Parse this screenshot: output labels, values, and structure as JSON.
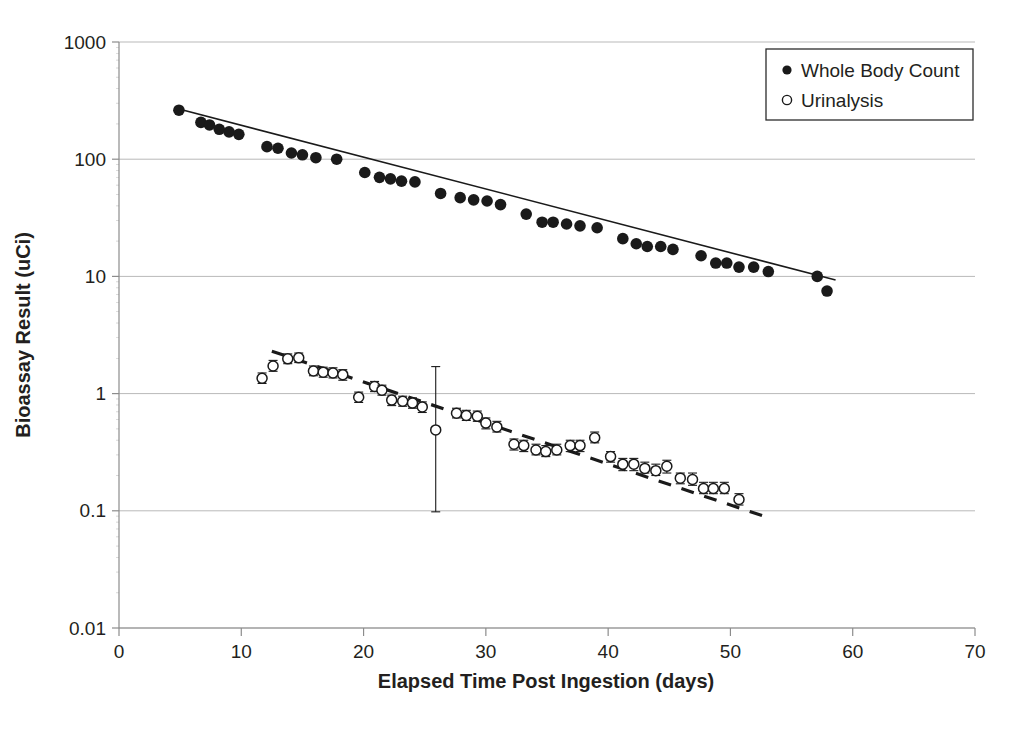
{
  "chart_data": {
    "type": "scatter",
    "title": "",
    "xlabel": "Elapsed Time Post Ingestion (days)",
    "ylabel": "Bioassay Result (uCi)",
    "xlim": [
      0,
      70
    ],
    "ylim": [
      0.01,
      1000
    ],
    "yscale": "log",
    "xscale": "linear",
    "grid": true,
    "grid_axis": "y",
    "xticks": [
      0,
      10,
      20,
      30,
      40,
      50,
      60,
      70
    ],
    "xticklabels": [
      "0",
      "10",
      "20",
      "30",
      "40",
      "50",
      "60",
      "70"
    ],
    "yticks": [
      0.01,
      0.1,
      1,
      10,
      100,
      1000
    ],
    "yticklabels": [
      "0.01",
      "0.1",
      "1",
      "10",
      "100",
      "1000"
    ],
    "legend_position": "upper right",
    "series": [
      {
        "name": "Whole Body Count",
        "marker": "filled-circle",
        "color": "#1a1a1a",
        "has_error_bars": false,
        "points": [
          {
            "x": 4.9,
            "y": 262
          },
          {
            "x": 6.7,
            "y": 206
          },
          {
            "x": 7.4,
            "y": 196
          },
          {
            "x": 8.2,
            "y": 180
          },
          {
            "x": 9.0,
            "y": 171
          },
          {
            "x": 9.8,
            "y": 163
          },
          {
            "x": 12.1,
            "y": 128
          },
          {
            "x": 13.0,
            "y": 124
          },
          {
            "x": 14.1,
            "y": 113
          },
          {
            "x": 15.0,
            "y": 109
          },
          {
            "x": 16.1,
            "y": 103
          },
          {
            "x": 17.8,
            "y": 100
          },
          {
            "x": 20.1,
            "y": 77
          },
          {
            "x": 21.3,
            "y": 70
          },
          {
            "x": 22.2,
            "y": 68
          },
          {
            "x": 23.1,
            "y": 65
          },
          {
            "x": 24.2,
            "y": 64
          },
          {
            "x": 26.3,
            "y": 51
          },
          {
            "x": 27.9,
            "y": 47
          },
          {
            "x": 29.0,
            "y": 45
          },
          {
            "x": 30.1,
            "y": 44
          },
          {
            "x": 31.2,
            "y": 41
          },
          {
            "x": 33.3,
            "y": 34
          },
          {
            "x": 34.6,
            "y": 29
          },
          {
            "x": 35.5,
            "y": 29
          },
          {
            "x": 36.6,
            "y": 28
          },
          {
            "x": 37.7,
            "y": 27
          },
          {
            "x": 39.1,
            "y": 26
          },
          {
            "x": 41.2,
            "y": 21
          },
          {
            "x": 42.3,
            "y": 19
          },
          {
            "x": 43.2,
            "y": 18
          },
          {
            "x": 44.3,
            "y": 18
          },
          {
            "x": 45.3,
            "y": 17
          },
          {
            "x": 47.6,
            "y": 15
          },
          {
            "x": 48.8,
            "y": 13
          },
          {
            "x": 49.7,
            "y": 13
          },
          {
            "x": 50.7,
            "y": 12
          },
          {
            "x": 51.9,
            "y": 12
          },
          {
            "x": 53.1,
            "y": 11
          },
          {
            "x": 57.1,
            "y": 10
          },
          {
            "x": 57.9,
            "y": 7.5
          }
        ],
        "trend_line": {
          "style": "solid",
          "x_start": 4.9,
          "y_start": 268,
          "x_end": 58.6,
          "y_end": 9.3
        }
      },
      {
        "name": "Urinalysis",
        "marker": "open-circle",
        "color": "#1a1a1a",
        "has_error_bars": true,
        "points": [
          {
            "x": 11.7,
            "y": 1.35,
            "err_low": 1.22,
            "err_high": 1.5
          },
          {
            "x": 12.6,
            "y": 1.72,
            "err_low": 1.55,
            "err_high": 1.92
          },
          {
            "x": 13.8,
            "y": 1.98,
            "err_low": 1.8,
            "err_high": 2.18
          },
          {
            "x": 14.7,
            "y": 2.02,
            "err_low": 1.84,
            "err_high": 2.22
          },
          {
            "x": 15.9,
            "y": 1.56,
            "err_low": 1.42,
            "err_high": 1.72
          },
          {
            "x": 16.7,
            "y": 1.52,
            "err_low": 1.38,
            "err_high": 1.68
          },
          {
            "x": 17.5,
            "y": 1.5,
            "err_low": 1.36,
            "err_high": 1.66
          },
          {
            "x": 18.3,
            "y": 1.45,
            "err_low": 1.3,
            "err_high": 1.6
          },
          {
            "x": 19.6,
            "y": 0.93,
            "err_low": 0.84,
            "err_high": 1.03
          },
          {
            "x": 20.9,
            "y": 1.15,
            "err_low": 1.04,
            "err_high": 1.27
          },
          {
            "x": 21.5,
            "y": 1.07,
            "err_low": 0.97,
            "err_high": 1.18
          },
          {
            "x": 22.3,
            "y": 0.88,
            "err_low": 0.79,
            "err_high": 0.97
          },
          {
            "x": 23.2,
            "y": 0.86,
            "err_low": 0.78,
            "err_high": 0.95
          },
          {
            "x": 24.0,
            "y": 0.83,
            "err_low": 0.75,
            "err_high": 0.92
          },
          {
            "x": 24.8,
            "y": 0.77,
            "err_low": 0.69,
            "err_high": 0.85
          },
          {
            "x": 25.9,
            "y": 0.49,
            "err_low": 0.098,
            "err_high": 1.7
          },
          {
            "x": 27.6,
            "y": 0.68,
            "err_low": 0.62,
            "err_high": 0.75
          },
          {
            "x": 28.4,
            "y": 0.65,
            "err_low": 0.59,
            "err_high": 0.72
          },
          {
            "x": 29.3,
            "y": 0.64,
            "err_low": 0.58,
            "err_high": 0.71
          },
          {
            "x": 30.0,
            "y": 0.56,
            "err_low": 0.5,
            "err_high": 0.62
          },
          {
            "x": 30.9,
            "y": 0.52,
            "err_low": 0.47,
            "err_high": 0.58
          },
          {
            "x": 32.3,
            "y": 0.37,
            "err_low": 0.33,
            "err_high": 0.41
          },
          {
            "x": 33.1,
            "y": 0.36,
            "err_low": 0.32,
            "err_high": 0.4
          },
          {
            "x": 34.1,
            "y": 0.33,
            "err_low": 0.3,
            "err_high": 0.37
          },
          {
            "x": 34.9,
            "y": 0.32,
            "err_low": 0.29,
            "err_high": 0.36
          },
          {
            "x": 35.8,
            "y": 0.33,
            "err_low": 0.3,
            "err_high": 0.37
          },
          {
            "x": 36.9,
            "y": 0.36,
            "err_low": 0.32,
            "err_high": 0.4
          },
          {
            "x": 37.7,
            "y": 0.36,
            "err_low": 0.32,
            "err_high": 0.4
          },
          {
            "x": 38.9,
            "y": 0.42,
            "err_low": 0.38,
            "err_high": 0.47
          },
          {
            "x": 40.2,
            "y": 0.29,
            "err_low": 0.26,
            "err_high": 0.32
          },
          {
            "x": 41.2,
            "y": 0.25,
            "err_low": 0.22,
            "err_high": 0.28
          },
          {
            "x": 42.1,
            "y": 0.25,
            "err_low": 0.22,
            "err_high": 0.28
          },
          {
            "x": 43.0,
            "y": 0.23,
            "err_low": 0.21,
            "err_high": 0.26
          },
          {
            "x": 43.9,
            "y": 0.22,
            "err_low": 0.2,
            "err_high": 0.25
          },
          {
            "x": 44.8,
            "y": 0.24,
            "err_low": 0.21,
            "err_high": 0.27
          },
          {
            "x": 45.9,
            "y": 0.19,
            "err_low": 0.17,
            "err_high": 0.21
          },
          {
            "x": 46.9,
            "y": 0.185,
            "err_low": 0.165,
            "err_high": 0.21
          },
          {
            "x": 47.8,
            "y": 0.155,
            "err_low": 0.14,
            "err_high": 0.175
          },
          {
            "x": 48.6,
            "y": 0.155,
            "err_low": 0.14,
            "err_high": 0.175
          },
          {
            "x": 49.5,
            "y": 0.155,
            "err_low": 0.14,
            "err_high": 0.175
          },
          {
            "x": 50.7,
            "y": 0.125,
            "err_low": 0.112,
            "err_high": 0.14
          }
        ],
        "trend_line": {
          "style": "dashed",
          "x_start": 12.5,
          "y_start": 2.3,
          "x_end": 53.0,
          "y_end": 0.088
        }
      }
    ]
  },
  "legend": {
    "entries": [
      {
        "label": "Whole Body Count",
        "marker": "filled-circle"
      },
      {
        "label": "Urinalysis",
        "marker": "open-circle"
      }
    ]
  },
  "axes": {
    "x_title": "Elapsed Time Post Ingestion (days)",
    "y_title": "Bioassay Result (uCi)"
  },
  "colors": {
    "ink": "#231f20",
    "marker": "#1a1a1a",
    "grid": "#b9b9b9",
    "axis": "#8c8c8c",
    "background": "#ffffff"
  }
}
